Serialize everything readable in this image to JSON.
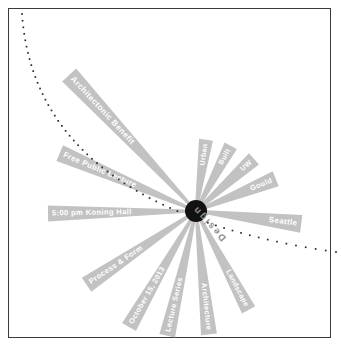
{
  "poster": {
    "title_label": "Design",
    "center_marker": "hub-dot",
    "background_color": "#ffffff",
    "border_color": "#3a3a3a",
    "ray_color": "#c2c2c2",
    "ray_text_color": "#ffffff",
    "hub_color": "#111111",
    "dotted_arc_color": "#2b2b2b",
    "design_label_color": "#8f8f8f"
  },
  "rays": [
    {
      "id": "ray-architectonic-benefit",
      "label": "Architectonic Benefit",
      "angle": -133,
      "length": 186,
      "half_width": 9.5,
      "font_size": 8.2,
      "text_offset": 30,
      "flip": false
    },
    {
      "id": "ray-free-public-lecture",
      "label": "Free Public Lecture",
      "angle": -157,
      "length": 148,
      "half_width": 8.5,
      "font_size": 7.8,
      "text_offset": 26,
      "flip": false
    },
    {
      "id": "ray-koning-hall",
      "label": "5:00 pm Koning Hall",
      "angle": 179,
      "length": 148,
      "half_width": 8.0,
      "font_size": 7.6,
      "text_offset": 26,
      "flip": false
    },
    {
      "id": "ray-process-form",
      "label": "Process & Form",
      "angle": 146,
      "length": 132,
      "half_width": 8.5,
      "font_size": 7.6,
      "text_offset": 24,
      "flip": false
    },
    {
      "id": "ray-october-15",
      "label": "October 15, 2013",
      "angle": 120,
      "length": 134,
      "half_width": 8.0,
      "font_size": 7.4,
      "text_offset": 24,
      "flip": false
    },
    {
      "id": "ray-lecture-series",
      "label": "Lecture Series",
      "angle": 103,
      "length": 128,
      "half_width": 8.0,
      "font_size": 7.4,
      "text_offset": 24,
      "flip": false
    },
    {
      "id": "ray-architecture",
      "label": "Architecture",
      "angle": 84,
      "length": 124,
      "half_width": 8.0,
      "font_size": 7.4,
      "text_offset": 24,
      "flip": false
    },
    {
      "id": "ray-landscape",
      "label": "Landscape",
      "angle": 62,
      "length": 112,
      "half_width": 7.5,
      "font_size": 7.2,
      "text_offset": 22,
      "flip": false
    },
    {
      "id": "ray-seattle",
      "label": "Seattle",
      "angle": 7,
      "length": 106,
      "half_width": 9.0,
      "font_size": 8.0,
      "text_offset": 36,
      "flip": false
    },
    {
      "id": "ray-gould",
      "label": "Gould",
      "angle": -22,
      "length": 86,
      "half_width": 8.0,
      "font_size": 7.4,
      "text_offset": 30,
      "flip": false
    },
    {
      "id": "ray-uw",
      "label": "UW",
      "angle": -42,
      "length": 78,
      "half_width": 7.5,
      "font_size": 7.2,
      "text_offset": 28,
      "flip": false
    },
    {
      "id": "ray-built",
      "label": "Built",
      "angle": -62,
      "length": 74,
      "half_width": 7.0,
      "font_size": 7.0,
      "text_offset": 26,
      "flip": false
    },
    {
      "id": "ray-urban",
      "label": "Urban",
      "angle": -82,
      "length": 72,
      "half_width": 7.0,
      "font_size": 7.0,
      "text_offset": 24,
      "flip": false
    }
  ],
  "arc": {
    "id": "dotted-arc",
    "dot_count": 58,
    "dot_size": 1.7,
    "description": "dotted-curve"
  }
}
